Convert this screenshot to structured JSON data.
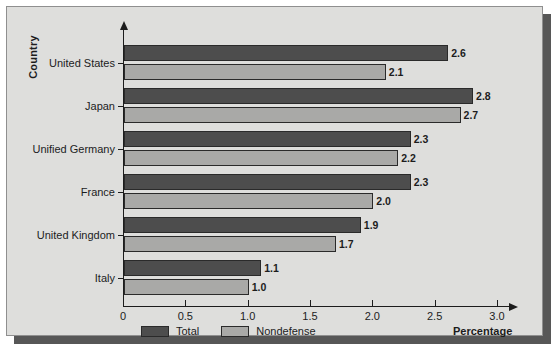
{
  "figure": {
    "background_color": "#dededc",
    "shadow_color": "#575757",
    "axis_color": "#1c1c1c"
  },
  "axes": {
    "y_title": "Country",
    "x_title": "Percentage"
  },
  "legend": {
    "items": [
      {
        "label": "Total",
        "color": "#4d4d4d",
        "icon": "legend-swatch-total"
      },
      {
        "label": "Nondefense",
        "color": "#a9a9a7",
        "icon": "legend-swatch-nondefense"
      }
    ]
  },
  "chart_data": {
    "type": "bar",
    "orientation": "horizontal",
    "title": "",
    "xlabel": "Percentage",
    "ylabel": "Country",
    "xlim": [
      0,
      3.0
    ],
    "xticks": [
      0,
      0.5,
      1.0,
      1.5,
      2.0,
      2.5,
      3.0
    ],
    "xticklabels": [
      "0",
      "0.5",
      "1.0",
      "1.5",
      "2.0",
      "2.5",
      "3.0"
    ],
    "grid": false,
    "legend_position": "bottom-left",
    "categories": [
      "United States",
      "Japan",
      "Unified Germany",
      "France",
      "United Kingdom",
      "Italy"
    ],
    "series": [
      {
        "name": "Total",
        "color": "#4d4d4d",
        "values": [
          2.6,
          2.8,
          2.3,
          2.3,
          1.9,
          1.1
        ],
        "labels": [
          "2.6",
          "2.8",
          "2.3",
          "2.3",
          "1.9",
          "1.1"
        ]
      },
      {
        "name": "Nondefense",
        "color": "#a9a9a7",
        "values": [
          2.1,
          2.7,
          2.2,
          2.0,
          1.7,
          1.0
        ],
        "labels": [
          "2.1",
          "2.7",
          "2.2",
          "2.0",
          "1.7",
          "1.0"
        ]
      }
    ]
  }
}
